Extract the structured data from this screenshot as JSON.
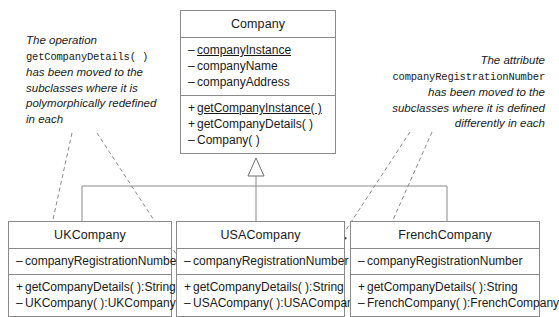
{
  "diagram": {
    "type": "uml-class-diagram",
    "background": "#ffffff",
    "line_color": "#8a8a8a",
    "text_color": "#1a1a1a"
  },
  "superclass": {
    "name": "Company",
    "attributes": [
      {
        "visibility": "–",
        "text": "companyInstance",
        "static": true
      },
      {
        "visibility": "–",
        "text": "companyName",
        "static": false
      },
      {
        "visibility": "–",
        "text": "companyAddress",
        "static": false
      }
    ],
    "operations": [
      {
        "visibility": "+",
        "text": "getCompanyInstance( )",
        "static": true
      },
      {
        "visibility": "+",
        "text": "getCompanyDetails( )",
        "static": false
      },
      {
        "visibility": "–",
        "text": "Company( )",
        "static": false
      }
    ]
  },
  "subclasses": [
    {
      "name": "UKCompany",
      "attributes": [
        {
          "visibility": "–",
          "text": "companyRegistrationNumber",
          "static": false
        }
      ],
      "operations": [
        {
          "visibility": "+",
          "text": "getCompanyDetails( ):String",
          "static": false
        },
        {
          "visibility": "–",
          "text": "UKCompany( ):UKCompany",
          "static": false
        }
      ]
    },
    {
      "name": "USACompany",
      "attributes": [
        {
          "visibility": "–",
          "text": "companyRegistrationNumber",
          "static": false
        }
      ],
      "operations": [
        {
          "visibility": "+",
          "text": "getCompanyDetails( ):String",
          "static": false
        },
        {
          "visibility": "–",
          "text": "USACompany( ):USACompany",
          "static": false
        }
      ]
    },
    {
      "name": "FrenchCompany",
      "attributes": [
        {
          "visibility": "–",
          "text": "companyRegistrationNumber",
          "static": false
        }
      ],
      "operations": [
        {
          "visibility": "+",
          "text": "getCompanyDetails( ):String",
          "static": false
        },
        {
          "visibility": "–",
          "text": "FrenchCompany( ):FrenchCompany",
          "static": false
        }
      ]
    }
  ],
  "notes": {
    "left": {
      "line1": "The operation",
      "mono": "getCompanyDetails( )",
      "line2": "has been moved to the",
      "line3": "subclasses where it is",
      "line4": "polymorphically redefined",
      "line5": "in each"
    },
    "right": {
      "line1": "The attribute",
      "mono": "companyRegistrationNumber",
      "line2": "has been moved to the",
      "line3": "subclasses where it is defined",
      "line4": "differently in each"
    }
  }
}
